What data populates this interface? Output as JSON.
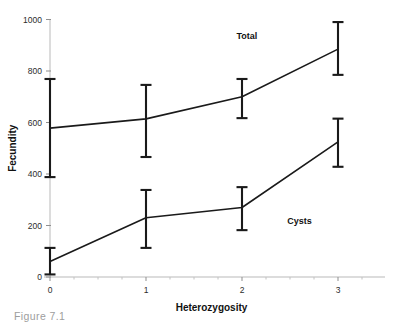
{
  "figure": {
    "caption_partial": "Figure 7.1"
  },
  "chart_data": {
    "type": "line",
    "title": "",
    "subtitle": "",
    "xlabel": "Heterozygosity",
    "ylabel": "Fecundity",
    "x": [
      0,
      1,
      2,
      3
    ],
    "xtick_labels": [
      "0",
      "1",
      "2",
      "3"
    ],
    "ytick_labels": [
      "0",
      "200",
      "400",
      "600",
      "800",
      "1000"
    ],
    "yticks": [
      0,
      200,
      400,
      600,
      800,
      1000
    ],
    "xlim": [
      -0.15,
      3.5
    ],
    "ylim": [
      0,
      1000
    ],
    "grid": false,
    "legend_position": "inline-annotation",
    "error_bar_style": "capped",
    "marker": "none",
    "line_color": "#1a1a1a",
    "background_color": "#ffffff",
    "series": [
      {
        "name": "Total",
        "label_position": {
          "x": 2.05,
          "y": 925
        },
        "values": [
          578,
          614,
          700,
          885
        ],
        "err_upper": [
          769,
          746,
          769,
          990
        ],
        "err_lower": [
          388,
          466,
          617,
          785
        ]
      },
      {
        "name": "Cysts",
        "label_position": {
          "x": 2.6,
          "y": 205
        },
        "values": [
          60,
          230,
          270,
          525
        ],
        "err_upper": [
          113,
          338,
          349,
          615
        ],
        "err_lower": [
          10,
          113,
          182,
          428
        ]
      }
    ]
  }
}
